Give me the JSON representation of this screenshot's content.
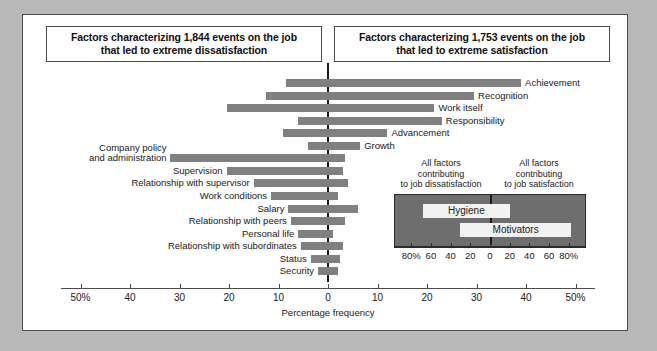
{
  "figure": {
    "frame_color": "#b9b9b9",
    "plate_color": "#ffffff",
    "bar_color": "#808080",
    "inset_fill": "#6e6e6e",
    "inset_bar_color": "#f2f2f2"
  },
  "headers": {
    "left_line1": "Factors characterizing 1,844 events on the job",
    "left_line2": "that led to extreme dissatisfaction",
    "right_line1": "Factors characterizing 1,753 events on the job",
    "right_line2": "that led to extreme satisfaction"
  },
  "chart_data": {
    "type": "bar",
    "orientation": "horizontal-diverging",
    "xlabel": "Percentage frequency",
    "ylabel": "",
    "xlim": [
      -55,
      55
    ],
    "tick_values": [
      -50,
      -40,
      -30,
      -20,
      -10,
      0,
      10,
      20,
      30,
      40,
      50
    ],
    "tick_labels": [
      "50%",
      "40",
      "30",
      "20",
      "10",
      "0",
      "10",
      "20",
      "30",
      "40",
      "50%"
    ],
    "grid": false,
    "legend": "none",
    "units": "percentage frequency",
    "note": "Bars extend from a negative (dissatisfaction) value to a positive (satisfaction) value.",
    "categories": [
      {
        "label": "Achievement",
        "label_side": "right",
        "group": "motivator",
        "neg": -8.5,
        "pos": 39.0
      },
      {
        "label": "Recognition",
        "label_side": "right",
        "group": "motivator",
        "neg": -12.5,
        "pos": 29.5
      },
      {
        "label": "Work itself",
        "label_side": "right",
        "group": "motivator",
        "neg": -20.5,
        "pos": 21.5
      },
      {
        "label": "Responsibility",
        "label_side": "right",
        "group": "motivator",
        "neg": -6.0,
        "pos": 23.0
      },
      {
        "label": "Advancement",
        "label_side": "right",
        "group": "motivator",
        "neg": -9.0,
        "pos": 12.0
      },
      {
        "label": "Growth",
        "label_side": "right",
        "group": "motivator",
        "neg": -4.0,
        "pos": 6.5
      },
      {
        "label": "Company policy and administration",
        "label_side": "left",
        "group": "hygiene",
        "neg": -32.0,
        "pos": 3.5
      },
      {
        "label": "Supervision",
        "label_side": "left",
        "group": "hygiene",
        "neg": -20.5,
        "pos": 3.0
      },
      {
        "label": "Relationship with supervisor",
        "label_side": "left",
        "group": "hygiene",
        "neg": -15.0,
        "pos": 4.0
      },
      {
        "label": "Work conditions",
        "label_side": "left",
        "group": "hygiene",
        "neg": -11.5,
        "pos": 2.0
      },
      {
        "label": "Salary",
        "label_side": "left",
        "group": "hygiene",
        "neg": -8.0,
        "pos": 6.0
      },
      {
        "label": "Relationship with peers",
        "label_side": "left",
        "group": "hygiene",
        "neg": -7.5,
        "pos": 3.5
      },
      {
        "label": "Personal life",
        "label_side": "left",
        "group": "hygiene",
        "neg": -6.0,
        "pos": 1.0
      },
      {
        "label": "Relationship with subordinates",
        "label_side": "left",
        "group": "hygiene",
        "neg": -5.5,
        "pos": 3.0
      },
      {
        "label": "Status",
        "label_side": "left",
        "group": "hygiene",
        "neg": -3.5,
        "pos": 2.5
      },
      {
        "label": "Security",
        "label_side": "left",
        "group": "hygiene",
        "neg": -2.0,
        "pos": 2.0
      }
    ]
  },
  "inset": {
    "caption_left_line1": "All factors",
    "caption_left_line2": "contributing",
    "caption_left_line3": "to job dissatisfaction",
    "caption_right_line1": "All factors",
    "caption_right_line2": "contributing",
    "caption_right_line3": "to job satisfaction",
    "chart_data": {
      "type": "bar",
      "orientation": "horizontal-diverging",
      "xlim": [
        -90,
        90
      ],
      "tick_values": [
        -80,
        -60,
        -40,
        -20,
        0,
        20,
        40,
        60,
        80
      ],
      "tick_labels": [
        "80%",
        "60",
        "40",
        "20",
        "0",
        "20",
        "40",
        "60",
        "80%"
      ],
      "categories": [
        {
          "label": "Hygiene",
          "neg": -69,
          "pos": 19
        },
        {
          "label": "Motivators",
          "neg": -31,
          "pos": 81
        }
      ]
    }
  }
}
